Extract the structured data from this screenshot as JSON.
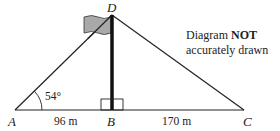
{
  "diagram": {
    "points": {
      "A": "A",
      "B": "B",
      "C": "C",
      "D": "D"
    },
    "angle_A": "54°",
    "length_AB": "96 m",
    "length_BC": "170 m",
    "note": {
      "line1_prefix": "Diagram ",
      "line1_bold": "NOT",
      "line2": "accurately drawn"
    },
    "colors": {
      "line": "#222222",
      "flag_fill": "#a9a9a9",
      "pole": "#111111"
    }
  }
}
